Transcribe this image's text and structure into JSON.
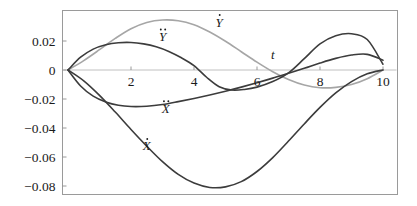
{
  "chart_data": {
    "type": "line",
    "title": "",
    "subtitle": "",
    "xlabel": "t",
    "ylabel": "",
    "xlim": [
      0,
      10
    ],
    "ylim": [
      -0.09,
      0.037
    ],
    "grid": false,
    "legend_position": "inline-annotations",
    "xticks": [
      2,
      4,
      6,
      8,
      10
    ],
    "xtick_labels": [
      "2",
      "4",
      "6",
      "8",
      "10"
    ],
    "yticks": [
      0.02,
      0,
      -0.02,
      -0.04,
      -0.06,
      -0.08
    ],
    "ytick_labels": [
      "0.02",
      "0",
      "-0.02",
      "-0.04",
      "-0.06",
      "-0.08"
    ],
    "annotations": [
      {
        "text": "t",
        "x": 6.5,
        "y": 0.0075,
        "role": "x-axis-label"
      }
    ],
    "series": [
      {
        "name": "Xdot",
        "label": "Ẋ",
        "label_base": "X",
        "label_dots": 1,
        "color": "#3c3c3c",
        "width": 1.6,
        "label_x": 2.5,
        "label_y": -0.0555,
        "x": [
          0,
          0.5,
          1,
          1.5,
          2,
          2.5,
          3,
          3.5,
          4,
          4.5,
          5,
          5.5,
          6,
          6.5,
          7,
          7.5,
          8,
          8.5,
          9,
          9.5,
          10
        ],
        "y": [
          0,
          -0.0075,
          -0.0175,
          -0.029,
          -0.041,
          -0.0525,
          -0.0632,
          -0.072,
          -0.078,
          -0.081,
          -0.0806,
          -0.077,
          -0.07,
          -0.0604,
          -0.049,
          -0.0372,
          -0.0258,
          -0.0158,
          -0.008,
          -0.0026,
          0
        ]
      },
      {
        "name": "Xddot",
        "label": "Ẍ",
        "label_base": "X",
        "label_dots": 2,
        "color": "#3c3c3c",
        "width": 1.6,
        "label_x": 3.1,
        "label_y": -0.0295,
        "x": [
          0,
          0.4,
          0.8,
          1.2,
          1.6,
          2,
          2.5,
          3,
          3.5,
          4,
          4.5,
          5,
          5.5,
          6,
          6.5,
          7,
          7.5,
          8,
          8.5,
          9,
          9.5,
          10
        ],
        "y": [
          0,
          -0.011,
          -0.018,
          -0.022,
          -0.0243,
          -0.0252,
          -0.025,
          -0.0238,
          -0.0218,
          -0.0196,
          -0.0172,
          -0.0146,
          -0.0118,
          -0.0088,
          -0.0056,
          -0.0022,
          0.0012,
          0.0048,
          0.008,
          0.0103,
          0.0108,
          0.0068
        ]
      },
      {
        "name": "Ydot",
        "label": "Ẏ",
        "label_base": "Y",
        "label_dots": 1,
        "color": "#a6a6a6",
        "width": 1.6,
        "label_x": 4.8,
        "label_y": 0.03,
        "x": [
          0,
          0.5,
          1,
          1.5,
          2,
          2.5,
          3,
          3.5,
          4,
          4.5,
          5,
          5.5,
          6,
          6.5,
          7,
          7.5,
          8,
          8.5,
          9,
          9.5,
          10
        ],
        "y": [
          0,
          0.0065,
          0.014,
          0.0218,
          0.0285,
          0.0328,
          0.0345,
          0.034,
          0.0312,
          0.0262,
          0.0198,
          0.0126,
          0.0054,
          -0.0012,
          -0.0066,
          -0.0104,
          -0.0122,
          -0.012,
          -0.01,
          -0.006,
          0
        ]
      },
      {
        "name": "Yddot",
        "label": "Ÿ",
        "label_base": "Y",
        "label_dots": 2,
        "color": "#3c3c3c",
        "width": 1.6,
        "label_x": 3.0,
        "label_y": 0.02,
        "x": [
          0,
          0.4,
          0.8,
          1.2,
          1.6,
          2,
          2.4,
          2.8,
          3.2,
          3.6,
          4,
          4.4,
          4.8,
          5.2,
          5.6,
          6,
          6.5,
          7,
          7.5,
          8,
          8.5,
          9,
          9.5,
          10
        ],
        "y": [
          0,
          0.0088,
          0.0144,
          0.0174,
          0.0188,
          0.019,
          0.018,
          0.016,
          0.0128,
          0.0084,
          0.003,
          -0.005,
          -0.0115,
          -0.0138,
          -0.0134,
          -0.0118,
          -0.008,
          -0.002,
          0.0078,
          0.018,
          0.0236,
          0.025,
          0.021,
          0.004
        ]
      }
    ]
  }
}
